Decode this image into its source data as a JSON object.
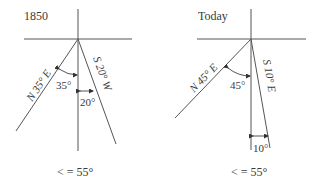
{
  "panels": [
    {
      "title": "1850",
      "line_left_label": "N 35° E",
      "line_right_label": "S 20° W",
      "angle_left": "35°",
      "angle_right": "20°",
      "caption": "< = 55°"
    },
    {
      "title": "Today",
      "line_left_label": "N 45° E",
      "line_right_label": "S 10° E",
      "angle_left": "45°",
      "angle_right": "10°",
      "caption": "< = 55°"
    }
  ]
}
